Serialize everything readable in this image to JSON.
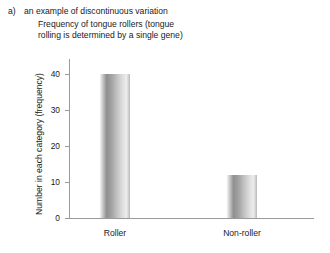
{
  "caption": {
    "marker": "a)",
    "label": "an example of discontinuous variation",
    "title_line1": "Frequency of tongue rollers (tongue",
    "title_line2": "rolling is determined by a single gene)"
  },
  "chart_data": {
    "type": "bar",
    "title": "Frequency of tongue rollers (tongue rolling is determined by a single gene)",
    "categories": [
      "Roller",
      "Non-roller"
    ],
    "values": [
      40,
      12
    ],
    "xlabel": "",
    "ylabel": "Number in each category (frequency)",
    "ylim": [
      0,
      45
    ],
    "yticks": [
      0,
      10,
      20,
      30,
      40
    ],
    "ytick_labels": [
      "0",
      "10",
      "20",
      "30",
      "40"
    ],
    "grid": false,
    "legend": false,
    "bar_color": "#a8a8a8",
    "axis_color": "#9a9a9a"
  }
}
